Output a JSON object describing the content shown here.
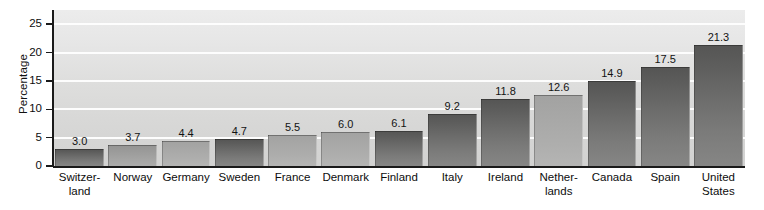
{
  "chart_data": {
    "type": "bar",
    "title": "",
    "subtitle": "",
    "xlabel": "",
    "ylabel": "Percentage",
    "ylim": [
      0,
      27.5
    ],
    "yticks": [
      0,
      5,
      10,
      15,
      20,
      25
    ],
    "ytick_labels": [
      "0",
      "5",
      "10",
      "15",
      "20",
      "25"
    ],
    "grid": true,
    "grid_axis": "y",
    "legend": false,
    "categories": [
      "Switzer-land",
      "Norway",
      "Germany",
      "Sweden",
      "France",
      "Denmark",
      "Finland",
      "Italy",
      "Ireland",
      "Nether-lands",
      "Canada",
      "Spain",
      "United States"
    ],
    "category_lines": [
      [
        "Switzer-",
        "land"
      ],
      [
        "Norway"
      ],
      [
        "Germany"
      ],
      [
        "Sweden"
      ],
      [
        "France"
      ],
      [
        "Denmark"
      ],
      [
        "Finland"
      ],
      [
        "Italy"
      ],
      [
        "Ireland"
      ],
      [
        "Nether-",
        "lands"
      ],
      [
        "Canada"
      ],
      [
        "Spain"
      ],
      [
        "United",
        "States"
      ]
    ],
    "values": [
      3.0,
      3.7,
      4.4,
      4.7,
      5.5,
      6.0,
      6.1,
      9.2,
      11.8,
      12.6,
      14.9,
      17.5,
      21.3
    ],
    "value_labels": [
      "3.0",
      "3.7",
      "4.4",
      "4.7",
      "5.5",
      "6.0",
      "6.1",
      "9.2",
      "11.8",
      "12.6",
      "14.9",
      "17.5",
      "21.3"
    ],
    "bar_shades": [
      "dark",
      "mid",
      "light",
      "dark",
      "light",
      "light",
      "dark",
      "dark",
      "dark",
      "light",
      "dark",
      "dark",
      "dark"
    ]
  },
  "colors": {
    "plot_background_top": "#ececec",
    "plot_background_bottom": "#d2d2d1",
    "gridline": "#fdfdfd",
    "axis": "#1a1a1a",
    "bar_dark": "#5e5e5d",
    "bar_mid": "#9b9b9a",
    "bar_light": "#a8a8a7",
    "text": "#0d0d0d",
    "page_background": "#ffffff"
  }
}
